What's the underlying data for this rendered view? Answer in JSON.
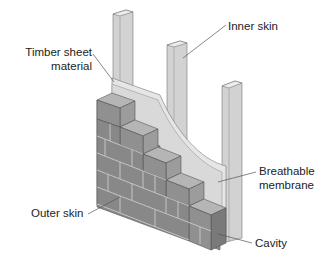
{
  "diagram": {
    "colors": {
      "brick_face": "#8f8f8f",
      "brick_top": "#b4b4b4",
      "brick_side": "#6f6f6f",
      "mortar": "#c8c8c8",
      "timber": "#d2d2d2",
      "timber_dark": "#a8a8a8",
      "membrane": "#dcdcdc",
      "sheet": "#e8e8e8",
      "leader": "#555555",
      "text": "#222222"
    },
    "labels": {
      "inner_skin": "Inner skin",
      "timber_sheet_line1": "Timber sheet",
      "timber_sheet_line2": "material",
      "breathable_line1": "Breathable",
      "breathable_line2": "membrane",
      "outer_skin": "Outer skin",
      "cavity": "Cavity"
    }
  }
}
